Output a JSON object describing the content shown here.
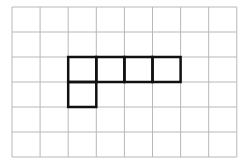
{
  "grid": {
    "cols": 8,
    "rows": 6,
    "origin_x": 12,
    "origin_y": 7,
    "cell_w": 28.1,
    "cell_h": 25,
    "line_color": "#b8b8b8",
    "shape_color": "#111111"
  },
  "shape": {
    "name": "pentomino-L-shape",
    "cells": [
      [
        2,
        2
      ],
      [
        3,
        2
      ],
      [
        4,
        2
      ],
      [
        5,
        2
      ],
      [
        2,
        3
      ]
    ]
  }
}
